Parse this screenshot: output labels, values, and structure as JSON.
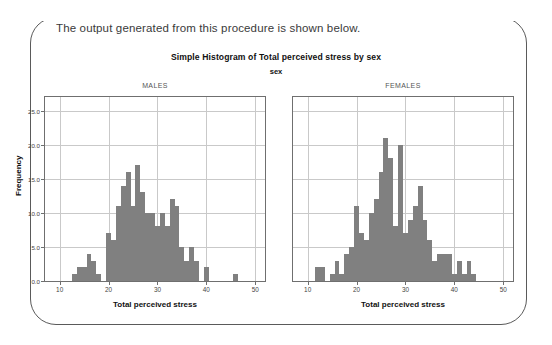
{
  "caption": "The output generated from this procedure is shown below.",
  "chart_data": {
    "type": "bar",
    "title": "Simple Histogram of Total perceived stress by sex",
    "subtitle": "sex",
    "xlabel": "Total perceived stress",
    "ylabel": "Frequency",
    "grid": true,
    "legend": "none",
    "bar_color": "#808080",
    "axis_color": "#6f6f6f",
    "grid_color": "#c9c9c9",
    "ylim": [
      0,
      27
    ],
    "yticks": [
      0,
      5,
      10,
      15,
      20,
      25
    ],
    "ytick_labels": [
      "0.0",
      "5.0",
      "10.0",
      "15.0",
      "20.0",
      "25.0"
    ],
    "xlim": [
      7,
      52
    ],
    "xticks": [
      10,
      20,
      30,
      40,
      50
    ],
    "xtick_labels": [
      "10",
      "20",
      "30",
      "40",
      "50"
    ],
    "panels": [
      {
        "name": "MALES",
        "xlabel": "Total perceived stress",
        "x": [
          13,
          14,
          15,
          16,
          17,
          18,
          19,
          20,
          21,
          22,
          23,
          24,
          25,
          26,
          27,
          28,
          29,
          30,
          31,
          32,
          33,
          34,
          35,
          36,
          37,
          38,
          39,
          40,
          45,
          46
        ],
        "values": [
          1,
          2,
          2,
          4,
          3,
          1,
          0,
          7,
          6,
          11,
          14,
          16,
          11,
          17,
          13,
          10,
          10,
          8,
          10,
          8,
          12,
          11,
          5,
          3,
          5,
          3,
          0,
          2,
          0,
          1
        ]
      },
      {
        "name": "FEMALES",
        "xlabel": "Total perceived stress",
        "x": [
          12,
          13,
          14,
          15,
          16,
          17,
          18,
          19,
          20,
          21,
          22,
          23,
          24,
          25,
          26,
          27,
          28,
          29,
          30,
          31,
          32,
          33,
          34,
          35,
          36,
          37,
          38,
          39,
          40,
          41,
          42,
          43,
          44
        ],
        "values": [
          2,
          2,
          0,
          1,
          3,
          1,
          4,
          5,
          11,
          7,
          6,
          10,
          12,
          16,
          21,
          18,
          8,
          20,
          7,
          9,
          11,
          14,
          9,
          6,
          3,
          4,
          4,
          4,
          1,
          3,
          1,
          3,
          1
        ]
      }
    ]
  }
}
